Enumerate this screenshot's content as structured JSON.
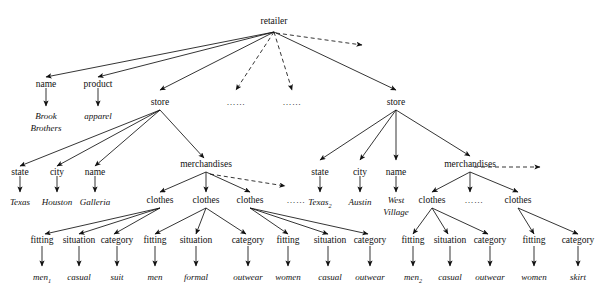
{
  "diagram": {
    "type": "tree",
    "root": "retailer",
    "edge_styles": {
      "solid": "child edge",
      "dashed": "elided/omitted child edge"
    },
    "colors": {
      "stroke": "#111111",
      "background": "#ffffff",
      "text": "#111111"
    }
  },
  "nodes": {
    "root": "retailer",
    "r_name": "name",
    "r_name_val": "Brook Brothers",
    "r_product": "product",
    "r_product_val": "apparel",
    "store1": "store",
    "ellipsis1": "……",
    "ellipsis2": "……",
    "store2": "store",
    "s1_state": "state",
    "s1_state_val": "Texas",
    "s1_city": "city",
    "s1_city_val": "Houston",
    "s1_name": "name",
    "s1_name_val": "Galleria",
    "s1_merch": "merchandises",
    "s1_clothes_a": "clothes",
    "s1_clothes_b": "clothes",
    "s1_clothes_c": "clothes",
    "s1_merch_ellipsis": "……",
    "a_fitting": "fitting",
    "a_fitting_val": "men",
    "a_fitting_val_sub": "1",
    "a_situation": "situation",
    "a_situation_val": "casual",
    "a_category": "category",
    "a_category_val": "suit",
    "b_fitting": "fitting",
    "b_fitting_val": "men",
    "b_situation": "situation",
    "b_situation_val": "formal",
    "b_category": "category",
    "b_category_val": "outwear",
    "c_fitting": "fitting",
    "c_fitting_val": "women",
    "c_situation": "situation",
    "c_situation_val": "casual",
    "c_category": "category",
    "c_category_val": "outwear",
    "s2_state": "state",
    "s2_state_val": "Texas",
    "s2_state_val_sub": "2",
    "s2_city": "city",
    "s2_city_val": "Austin",
    "s2_name": "name",
    "s2_name_val_line1": "West",
    "s2_name_val_line2": "Village",
    "s2_merch": "merchandises",
    "s2_clothes_a": "clothes",
    "s2_merch_ellipsis": "……",
    "s2_clothes_b": "clothes",
    "d_fitting": "fitting",
    "d_fitting_val": "men",
    "d_fitting_val_sub": "2",
    "d_situation": "situation",
    "d_situation_val": "casual",
    "d_category": "category",
    "d_category_val": "outwear",
    "e_fitting": "fitting",
    "e_fitting_val": "women",
    "e_category": "category",
    "e_category_val": "skirt"
  }
}
